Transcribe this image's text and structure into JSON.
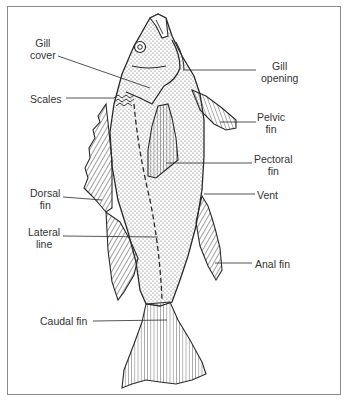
{
  "diagram": {
    "title": "",
    "labels": {
      "gill_cover": "Gill\ncover",
      "scales": "Scales",
      "dorsal_fin": "Dorsal\nfin",
      "lateral_line": "Lateral\nline",
      "caudal_fin": "Caudal fin",
      "gill_opening": "Gill\nopening",
      "pelvic_fin": "Pelvic\nfin",
      "pectoral_fin": "Pectoral\nfin",
      "vent": "Vent",
      "anal_fin": "Anal fin"
    },
    "colors": {
      "line": "#2a2a2a",
      "stipple": "#555555",
      "border": "#8a8a8a",
      "text": "#333333"
    }
  }
}
